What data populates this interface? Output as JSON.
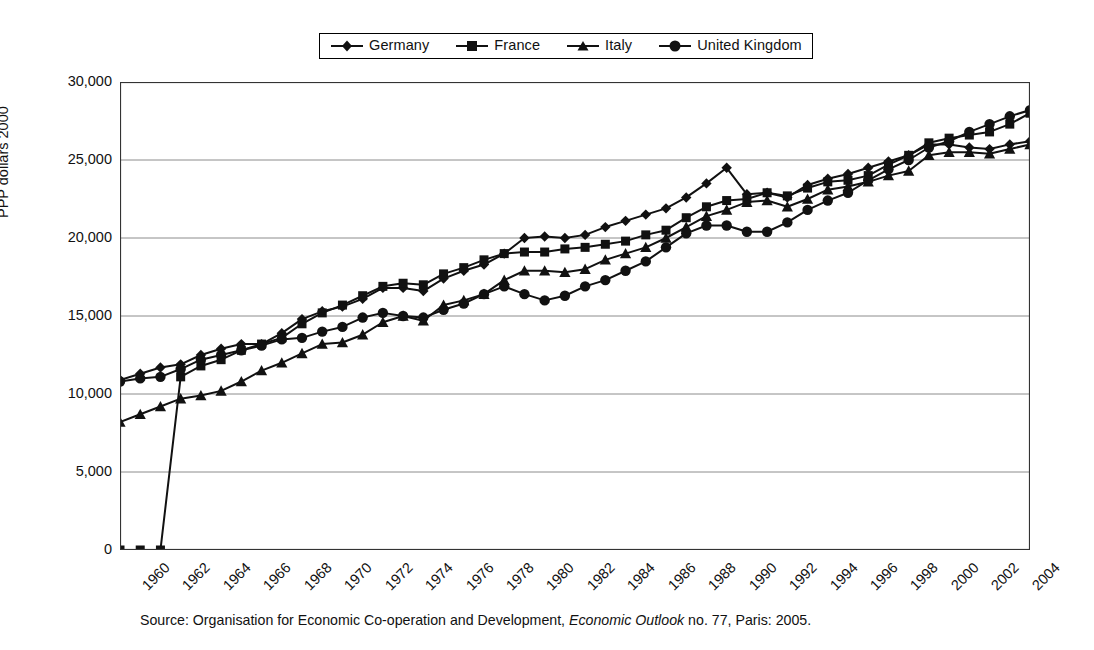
{
  "legend": {
    "position": "top-center",
    "entries": [
      {
        "label": "Germany",
        "marker": "diamond-marker-icon"
      },
      {
        "label": "France",
        "marker": "square-marker-icon"
      },
      {
        "label": "Italy",
        "marker": "triangle-marker-icon"
      },
      {
        "label": "United Kingdom",
        "marker": "circle-marker-icon"
      }
    ]
  },
  "axes": {
    "y_title": "PPP dollars 2000",
    "y_ticks": [
      "0",
      "5,000",
      "10,000",
      "15,000",
      "20,000",
      "25,000",
      "30,000"
    ],
    "x_ticks": [
      "1960",
      "1962",
      "1964",
      "1966",
      "1968",
      "1970",
      "1972",
      "1974",
      "1976",
      "1978",
      "1980",
      "1982",
      "1984",
      "1986",
      "1988",
      "1990",
      "1992",
      "1994",
      "1996",
      "1998",
      "2000",
      "2002",
      "2004"
    ]
  },
  "source": {
    "prefix": "Source: Organisation for Economic Co-operation and Development, ",
    "italic": "Economic Outlook",
    "suffix": " no. 77, Paris: 2005."
  },
  "colors": {
    "series": "#111111",
    "grid": "#8c8c8c",
    "axis": "#333333",
    "background": "#ffffff"
  },
  "chart_data": {
    "type": "line",
    "title": "",
    "xlabel": "",
    "ylabel": "PPP dollars 2000",
    "xlim": [
      1960,
      2005
    ],
    "ylim": [
      0,
      30000
    ],
    "grid": true,
    "legend_position": "top-center",
    "x": [
      1960,
      1961,
      1962,
      1963,
      1964,
      1965,
      1966,
      1967,
      1968,
      1969,
      1970,
      1971,
      1972,
      1973,
      1974,
      1975,
      1976,
      1977,
      1978,
      1979,
      1980,
      1981,
      1982,
      1983,
      1984,
      1985,
      1986,
      1987,
      1988,
      1989,
      1990,
      1991,
      1992,
      1993,
      1994,
      1995,
      1996,
      1997,
      1998,
      1999,
      2000,
      2001,
      2002,
      2003,
      2004,
      2005
    ],
    "series": [
      {
        "name": "Germany",
        "marker": "diamond",
        "values": [
          10900,
          11300,
          11700,
          11900,
          12500,
          12900,
          13200,
          13200,
          13900,
          14800,
          15300,
          15600,
          16100,
          16800,
          16800,
          16600,
          17400,
          17900,
          18300,
          19000,
          20000,
          20100,
          20000,
          20200,
          20700,
          21100,
          21500,
          21900,
          22600,
          23500,
          24500,
          22800,
          22900,
          22600,
          23400,
          23800,
          24100,
          24500,
          24900,
          25300,
          26000,
          26000,
          25800,
          25700,
          26000,
          26200
        ]
      },
      {
        "name": "France",
        "marker": "square",
        "values": [
          0,
          0,
          0,
          11100,
          11800,
          12200,
          12800,
          13200,
          13600,
          14500,
          15200,
          15700,
          16300,
          16900,
          17100,
          17000,
          17700,
          18100,
          18600,
          19000,
          19100,
          19100,
          19300,
          19400,
          19600,
          19800,
          20200,
          20500,
          21300,
          22000,
          22400,
          22500,
          22900,
          22700,
          23200,
          23600,
          23700,
          24000,
          24700,
          25300,
          26100,
          26400,
          26600,
          26800,
          27300,
          28000
        ]
      },
      {
        "name": "Italy",
        "marker": "triangle",
        "values": [
          8200,
          8700,
          9200,
          9700,
          9900,
          10200,
          10800,
          11500,
          12000,
          12600,
          13200,
          13300,
          13800,
          14600,
          15000,
          14700,
          15700,
          16000,
          16400,
          17300,
          17900,
          17900,
          17800,
          18000,
          18600,
          19000,
          19400,
          20000,
          20700,
          21400,
          21800,
          22300,
          22400,
          22000,
          22500,
          23100,
          23300,
          23600,
          24000,
          24300,
          25300,
          25500,
          25500,
          25400,
          25700,
          26000
        ]
      },
      {
        "name": "United Kingdom",
        "marker": "circle",
        "values": [
          10800,
          11000,
          11100,
          11600,
          12200,
          12500,
          12800,
          13100,
          13500,
          13600,
          14000,
          14300,
          14900,
          15200,
          15000,
          14900,
          15400,
          15800,
          16400,
          16900,
          16400,
          16000,
          16300,
          16900,
          17300,
          17900,
          18500,
          19400,
          20300,
          20800,
          20800,
          20400,
          20400,
          21000,
          21800,
          22400,
          22900,
          23700,
          24400,
          25000,
          25800,
          26200,
          26800,
          27300,
          27800,
          28200
        ]
      }
    ]
  }
}
